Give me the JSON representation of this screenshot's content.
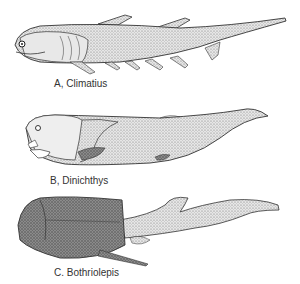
{
  "figures": [
    {
      "id": "A",
      "caption": "A, Climatius"
    },
    {
      "id": "B",
      "caption": "B, Dinichthys"
    },
    {
      "id": "C",
      "caption": "C. Bothriolepis"
    }
  ],
  "colors": {
    "ink": "#333333",
    "shade": "#9a9a9a",
    "light": "#dcdcdc",
    "dark": "#5a5a5a",
    "background": "#ffffff"
  }
}
